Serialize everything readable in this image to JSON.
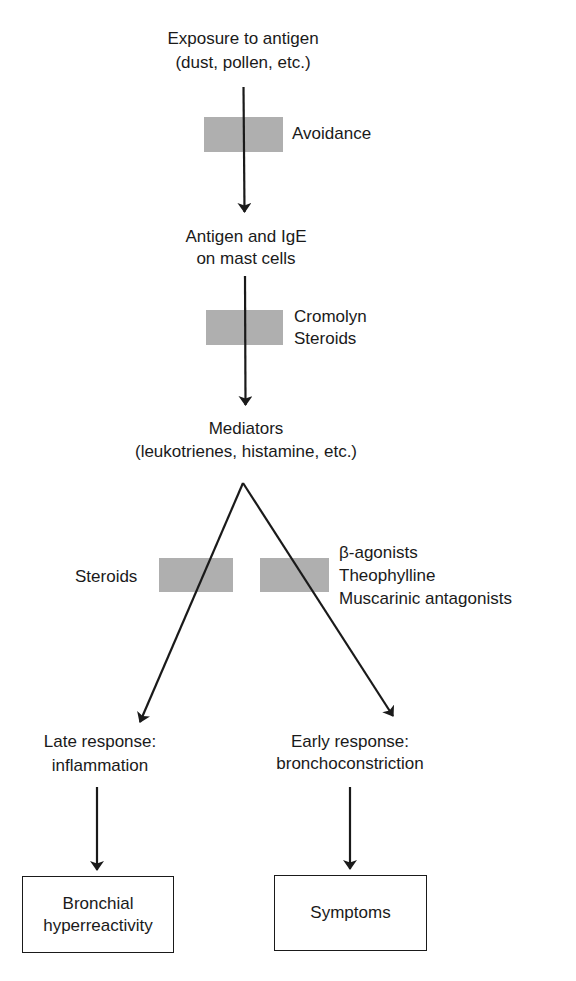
{
  "diagram": {
    "nodes": {
      "exposure": {
        "line1": "Exposure to antigen",
        "line2": "(dust, pollen, etc.)"
      },
      "antigen_ige": {
        "line1": "Antigen and IgE",
        "line2": "on mast cells"
      },
      "mediators": {
        "line1": "Mediators",
        "line2": "(leukotrienes, histamine, etc.)"
      },
      "late_response": {
        "line1": "Late response:",
        "line2": "inflammation"
      },
      "early_response": {
        "line1": "Early response:",
        "line2": "bronchoconstriction"
      },
      "bronchial_box": {
        "line1": "Bronchial",
        "line2": "hyperreactivity"
      },
      "symptoms_box": {
        "line1": "Symptoms"
      }
    },
    "blocks": {
      "avoidance": {
        "labels": [
          "Avoidance"
        ]
      },
      "mast_cell": {
        "labels": [
          "Cromolyn",
          "Steroids"
        ]
      },
      "late": {
        "labels": [
          "Steroids"
        ]
      },
      "early": {
        "labels": [
          "β-agonists",
          "Theophylline",
          "Muscarinic antagonists"
        ]
      }
    },
    "edges": [
      {
        "from": "exposure",
        "to": "antigen_ige",
        "blocked_by": "avoidance"
      },
      {
        "from": "antigen_ige",
        "to": "mediators",
        "blocked_by": "mast_cell"
      },
      {
        "from": "mediators",
        "to": "late_response",
        "blocked_by": "late"
      },
      {
        "from": "mediators",
        "to": "early_response",
        "blocked_by": "early"
      },
      {
        "from": "late_response",
        "to": "bronchial_box"
      },
      {
        "from": "early_response",
        "to": "symptoms_box"
      }
    ],
    "colors": {
      "line": "#1a1a1a",
      "block": "#d4d4d4",
      "background": "#ffffff"
    }
  }
}
